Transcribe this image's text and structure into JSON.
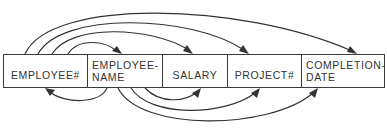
{
  "record": {
    "fields": [
      {
        "label": "EMPLOYEE#"
      },
      {
        "label_line1": "EMPLOYEE-",
        "label_line2": "NAME"
      },
      {
        "label": "SALARY"
      },
      {
        "label": "PROJECT#"
      },
      {
        "label_line1": "COMPLETION-",
        "label_line2": "DATE"
      }
    ]
  },
  "dependencies": {
    "from_employee_number": [
      "EMPLOYEE-NAME",
      "SALARY",
      "PROJECT#",
      "COMPLETION-DATE"
    ],
    "from_employee_name": [
      "EMPLOYEE#",
      "SALARY",
      "PROJECT#",
      "COMPLETION-DATE"
    ]
  },
  "colors": {
    "line": "#333333",
    "border": "#3a3a3a",
    "text": "#333333",
    "background": "#ffffff"
  }
}
